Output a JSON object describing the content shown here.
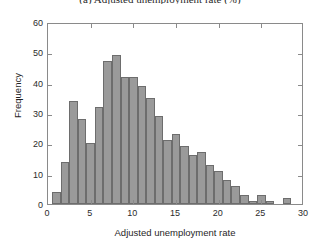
{
  "figure": {
    "caption": "(a) Adjusted unemployment rate (%)",
    "background_color": "#ffffff"
  },
  "chart_data": {
    "type": "bar",
    "title": "",
    "subtitle": "",
    "xlabel": "Adjusted unemployment rate",
    "ylabel": "Frequency",
    "xlim": [
      0,
      30
    ],
    "ylim": [
      0,
      60
    ],
    "xticks": [
      0,
      5,
      10,
      15,
      20,
      25,
      30
    ],
    "xticklabels": [
      "0",
      "5",
      "10",
      "15",
      "20",
      "25",
      "30"
    ],
    "yticks": [
      0,
      10,
      20,
      30,
      40,
      50,
      60
    ],
    "yticklabels": [
      "0",
      "10",
      "20",
      "30",
      "40",
      "50",
      "60"
    ],
    "grid": false,
    "legend": null,
    "legend_position": "none",
    "bar_color": "#9a9a9a",
    "bar_edge_color": "#6d6d6d",
    "axis_color": "#8a8a8a",
    "bin_width": 1,
    "bin_starts": [
      0.5,
      1.5,
      2.5,
      3.5,
      4.5,
      5.5,
      6.5,
      7.5,
      8.5,
      9.5,
      10.5,
      11.5,
      12.5,
      13.5,
      14.5,
      15.5,
      16.5,
      17.5,
      18.5,
      19.5,
      20.5,
      21.5,
      22.5,
      23.5,
      24.5,
      25.5,
      26.5,
      27.5
    ],
    "categories": [
      "0.5-1.5",
      "1.5-2.5",
      "2.5-3.5",
      "3.5-4.5",
      "4.5-5.5",
      "5.5-6.5",
      "6.5-7.5",
      "7.5-8.5",
      "8.5-9.5",
      "9.5-10.5",
      "10.5-11.5",
      "11.5-12.5",
      "12.5-13.5",
      "13.5-14.5",
      "14.5-15.5",
      "15.5-16.5",
      "16.5-17.5",
      "17.5-18.5",
      "18.5-19.5",
      "19.5-20.5",
      "20.5-21.5",
      "21.5-22.5",
      "22.5-23.5",
      "23.5-24.5",
      "24.5-25.5",
      "25.5-26.5",
      "26.5-27.5",
      "27.5-28.5"
    ],
    "values": [
      4,
      14,
      34,
      28,
      20,
      32,
      47,
      49,
      42,
      42,
      39,
      35,
      29,
      21,
      23,
      19,
      16,
      17,
      13,
      11,
      8,
      6,
      3,
      1,
      3,
      1,
      0,
      2
    ]
  }
}
